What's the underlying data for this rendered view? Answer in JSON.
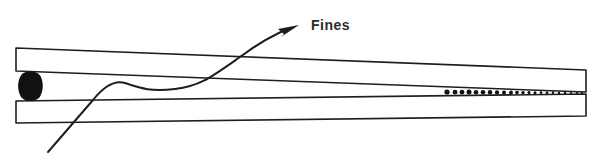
{
  "diagram": {
    "labels": {
      "fines": "Fines"
    },
    "elements": {
      "upper_plate": "upper wedge plate",
      "lower_plate": "lower wedge plate",
      "retained_particle": "large retained particle at wide gap end",
      "fines_particles": "fine particles trapped in narrow gap",
      "flow_arrow": "flow path arrow carrying fines"
    },
    "colors": {
      "line": "#1e1e1e",
      "fill": "#ffffff",
      "particle": "#111111"
    }
  }
}
